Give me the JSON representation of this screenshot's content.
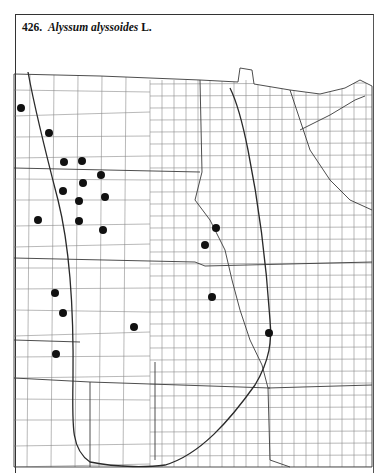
{
  "title": {
    "number": "426.",
    "species": "Alyssum alyssoides",
    "author": "L."
  },
  "map": {
    "type": "county dot-distribution map",
    "region": "Great Plains (county outlines)",
    "colors": {
      "ink": "#1a1a1a",
      "county_lines": "#8a8a8a",
      "state_lines": "#3a3a3a",
      "background": "#ffffff"
    },
    "occurrence_points": [
      {
        "x": 21,
        "y": 108
      },
      {
        "x": 49,
        "y": 133
      },
      {
        "x": 64,
        "y": 162
      },
      {
        "x": 82,
        "y": 161
      },
      {
        "x": 101,
        "y": 175
      },
      {
        "x": 83,
        "y": 183
      },
      {
        "x": 63,
        "y": 191
      },
      {
        "x": 105,
        "y": 197
      },
      {
        "x": 79,
        "y": 201
      },
      {
        "x": 38,
        "y": 220
      },
      {
        "x": 79,
        "y": 221
      },
      {
        "x": 103,
        "y": 230
      },
      {
        "x": 216,
        "y": 228
      },
      {
        "x": 205,
        "y": 245
      },
      {
        "x": 212,
        "y": 297
      },
      {
        "x": 269,
        "y": 333
      },
      {
        "x": 55,
        "y": 293
      },
      {
        "x": 63,
        "y": 313
      },
      {
        "x": 134,
        "y": 327
      },
      {
        "x": 56,
        "y": 354
      }
    ]
  }
}
